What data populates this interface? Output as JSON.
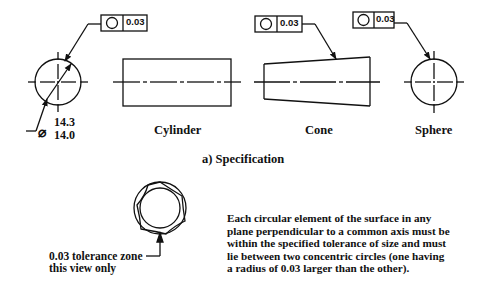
{
  "figure": {
    "caption": "a)  Specification",
    "shapes": [
      {
        "name": "Cylinder cross-section",
        "label": ""
      },
      {
        "name": "Cylinder",
        "label": "Cylinder"
      },
      {
        "name": "Cone",
        "label": "Cone"
      },
      {
        "name": "Sphere",
        "label": "Sphere"
      }
    ],
    "feature_control_frames": [
      {
        "symbol": "circularity",
        "tolerance": "0.03"
      },
      {
        "symbol": "circularity",
        "tolerance": "0.03"
      },
      {
        "symbol": "circularity",
        "tolerance": "0.03"
      }
    ],
    "diameter_dimension": {
      "symbol": "⌀",
      "upper": "14.3",
      "lower": "14.0"
    },
    "tolerance_zone": {
      "label_line1": "0.03 tolerance zone",
      "label_line2": "this view only"
    },
    "explanation": [
      "Each circular element of the surface in any",
      "plane perpendicular to a common axis must be",
      "within the specified tolerance of size and must",
      "lie between two concentric circles  (one having",
      "a radius of 0.03 larger than the other)."
    ]
  }
}
